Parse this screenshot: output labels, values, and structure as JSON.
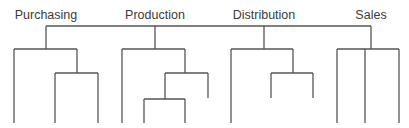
{
  "diagram": {
    "type": "organization-tree",
    "line_color": "#555555",
    "text_color": "#3a3a3a",
    "departments": [
      {
        "label": "Purchasing",
        "x": 46
      },
      {
        "label": "Production",
        "x": 155
      },
      {
        "label": "Distribution",
        "x": 264
      },
      {
        "label": "Sales",
        "x": 371
      }
    ]
  }
}
